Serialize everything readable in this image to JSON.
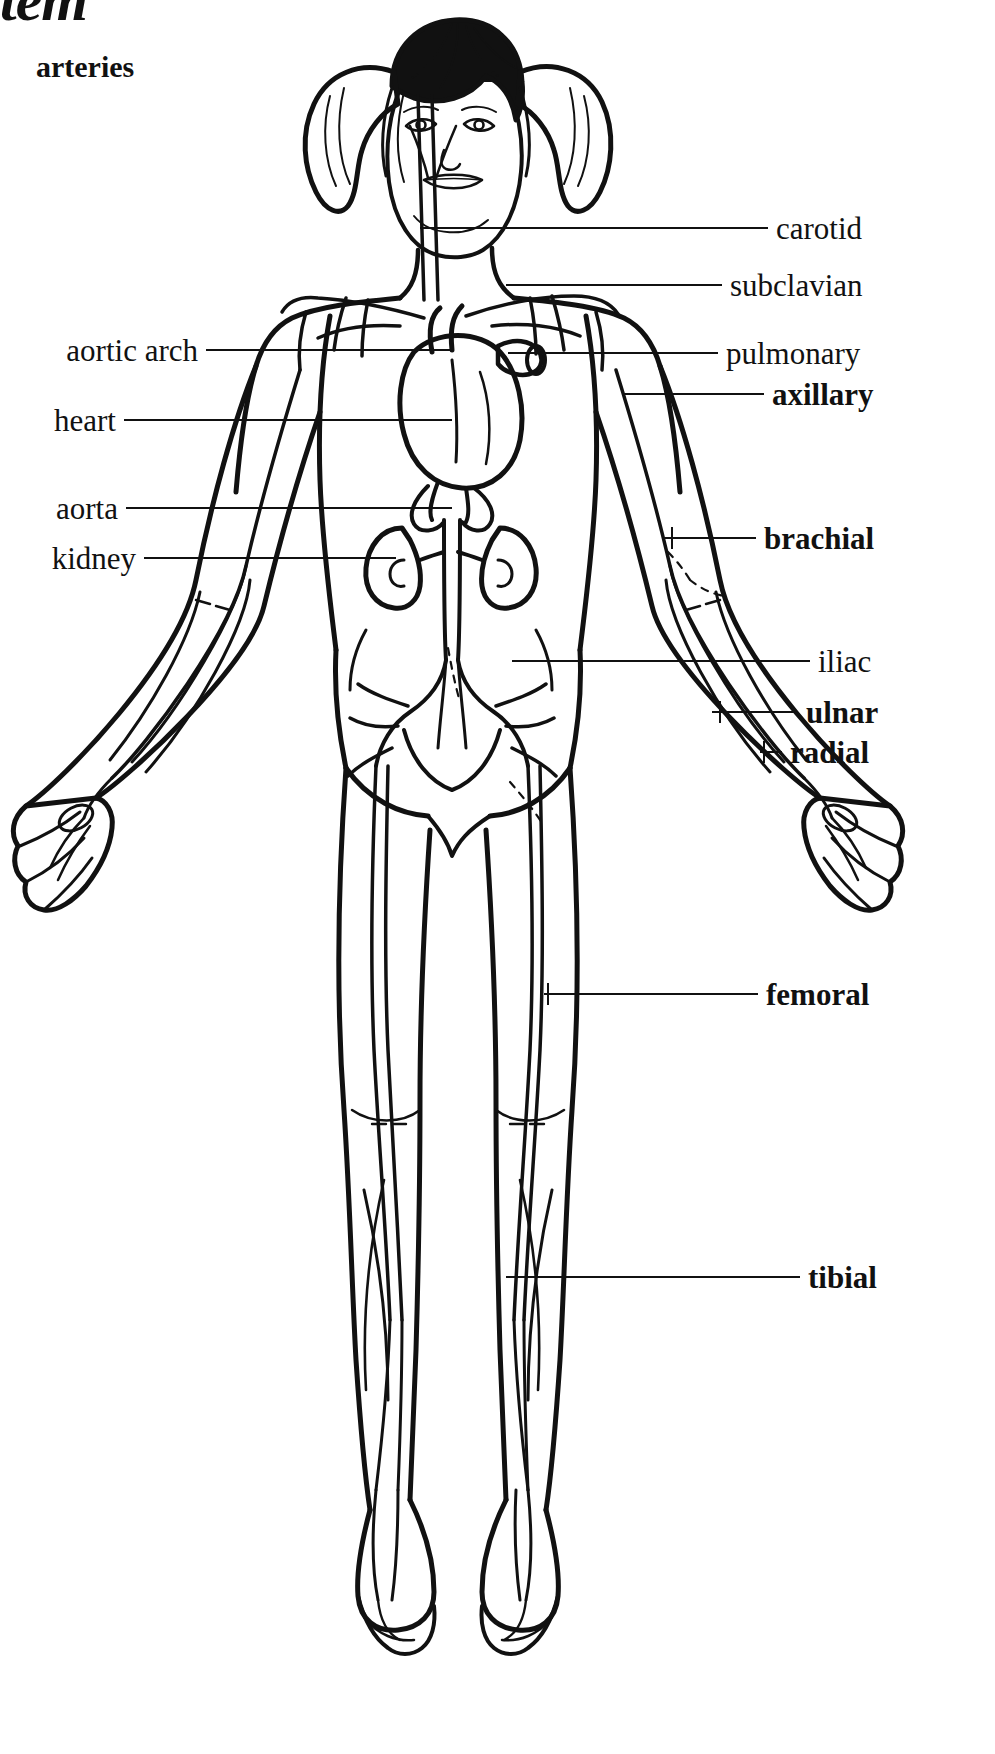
{
  "header": {
    "title_partial": "ystem",
    "subtitle": "arteries"
  },
  "diagram": {
    "kind": "anatomical-line-drawing",
    "figure_description": "front view outline drawing of a girl with pigtails showing arterial network, heart and kidneys"
  },
  "labels_left": [
    {
      "id": "aortic-arch",
      "text": "aortic arch",
      "text_right_x": 198,
      "y": 350,
      "leader_from_x": 206,
      "leader_to_x": 452,
      "bold": false
    },
    {
      "id": "heart",
      "text": "heart",
      "text_right_x": 116,
      "y": 420,
      "leader_from_x": 124,
      "leader_to_x": 452,
      "bold": false
    },
    {
      "id": "aorta",
      "text": "aorta",
      "text_right_x": 118,
      "y": 508,
      "leader_from_x": 126,
      "leader_to_x": 452,
      "bold": false
    },
    {
      "id": "kidney",
      "text": "kidney",
      "text_right_x": 136,
      "y": 558,
      "leader_from_x": 144,
      "leader_to_x": 396,
      "bold": false
    }
  ],
  "labels_right": [
    {
      "id": "carotid",
      "text": "carotid",
      "text_left_x": 776,
      "y": 228,
      "leader_from_x": 420,
      "leader_to_x": 768,
      "bold": false
    },
    {
      "id": "subclavian",
      "text": "subclavian",
      "text_left_x": 730,
      "y": 285,
      "leader_from_x": 506,
      "leader_to_x": 722,
      "bold": false
    },
    {
      "id": "pulmonary",
      "text": "pulmonary",
      "text_left_x": 726,
      "y": 353,
      "leader_from_x": 508,
      "leader_to_x": 718,
      "bold": false
    },
    {
      "id": "axillary",
      "text": "axillary",
      "text_left_x": 772,
      "y": 394,
      "leader_from_x": 624,
      "leader_to_x": 764,
      "bold": true
    },
    {
      "id": "brachial",
      "text": "brachial",
      "text_left_x": 764,
      "y": 538,
      "leader_from_x": 664,
      "leader_to_x": 756,
      "bold": true
    },
    {
      "id": "iliac",
      "text": "iliac",
      "text_left_x": 818,
      "y": 661,
      "leader_from_x": 512,
      "leader_to_x": 810,
      "bold": false
    },
    {
      "id": "ulnar",
      "text": "ulnar",
      "text_left_x": 806,
      "y": 712,
      "leader_from_x": 712,
      "leader_to_x": 798,
      "bold": true
    },
    {
      "id": "radial",
      "text": "radial",
      "text_left_x": 790,
      "y": 752,
      "leader_from_x": 760,
      "leader_to_x": 782,
      "bold": true
    },
    {
      "id": "femoral",
      "text": "femoral",
      "text_left_x": 766,
      "y": 994,
      "leader_from_x": 544,
      "leader_to_x": 758,
      "bold": true
    },
    {
      "id": "tibial",
      "text": "tibial",
      "text_left_x": 808,
      "y": 1277,
      "leader_from_x": 506,
      "leader_to_x": 800,
      "bold": true
    }
  ],
  "style": {
    "ink_color": "#111111",
    "background": "#ffffff"
  }
}
